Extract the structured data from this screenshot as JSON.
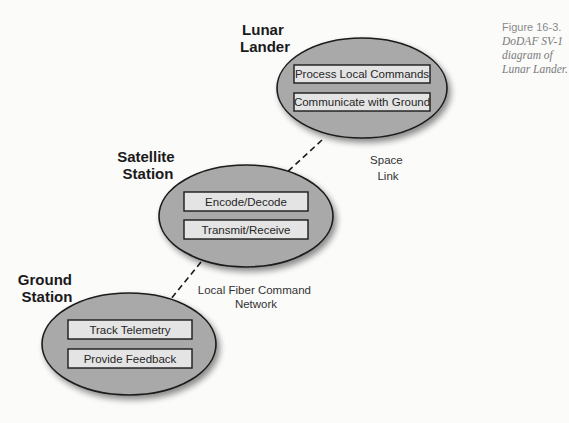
{
  "caption": {
    "number": "Figure 16-3.",
    "description": "DoDAF SV-1 diagram of Lunar Lander."
  },
  "colors": {
    "node_fill": "#a9a9a9",
    "box_fill": "#e4e4e4",
    "outline": "#1a1a1a"
  },
  "nodes": [
    {
      "title_lines": [
        "Lunar",
        "Lander"
      ],
      "functions": [
        "Process Local Commands",
        "Communicate with Ground"
      ]
    },
    {
      "title_lines": [
        "Satellite",
        "Station"
      ],
      "functions": [
        "Encode/Decode",
        "Transmit/Receive"
      ]
    },
    {
      "title_lines": [
        "Ground",
        "Station"
      ],
      "functions": [
        "Track Telemetry",
        "Provide Feedback"
      ]
    }
  ],
  "links": [
    {
      "from": "Lunar Lander",
      "to": "Satellite Station",
      "label_lines": [
        "Space",
        "Link"
      ],
      "style": "dashed"
    },
    {
      "from": "Satellite Station",
      "to": "Ground Station",
      "label_lines": [
        "Local Fiber Command",
        "Network"
      ],
      "style": "dashed"
    }
  ]
}
